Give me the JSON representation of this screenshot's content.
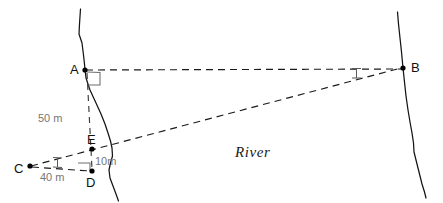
{
  "figure": {
    "caption_text": "River",
    "background_color": "#ffffff",
    "ink_color": "#141414",
    "dimension_color": "#777777"
  },
  "points": [
    {
      "id": "A",
      "label": "A",
      "x": 85,
      "y": 70,
      "label_x": 70,
      "label_y": 74
    },
    {
      "id": "B",
      "label": "B",
      "x": 403,
      "y": 68,
      "label_x": 411,
      "label_y": 72
    },
    {
      "id": "C",
      "label": "C",
      "x": 30,
      "y": 166,
      "label_x": 14,
      "label_y": 173
    },
    {
      "id": "D",
      "label": "D",
      "x": 92,
      "y": 171,
      "label_x": 86,
      "label_y": 187
    },
    {
      "id": "E",
      "label": "E",
      "x": 92,
      "y": 149,
      "label_x": 87,
      "label_y": 144
    }
  ],
  "dimensions": [
    {
      "id": "AE",
      "label": "50 m",
      "x": 38,
      "y": 122
    },
    {
      "id": "CD",
      "label": "40 m",
      "x": 40,
      "y": 180
    },
    {
      "id": "ED",
      "label": "10m",
      "x": 96,
      "y": 164
    }
  ],
  "segments": [
    {
      "id": "A-B",
      "from": "A",
      "to": "B",
      "style": "dashed"
    },
    {
      "id": "C-E-B",
      "from": "C",
      "to": "B",
      "style": "dashed",
      "through": "E"
    },
    {
      "id": "A-D",
      "from": "A",
      "to": "D",
      "style": "dashed-vertical"
    },
    {
      "id": "C-D",
      "from": "C",
      "to": "D",
      "style": "dashed"
    }
  ],
  "markers": [
    {
      "id": "right-angle-at-A",
      "kind": "right-angle",
      "at": "A"
    },
    {
      "id": "right-angle-at-D",
      "kind": "right-angle",
      "at": "D"
    },
    {
      "id": "angle-tick-at-B",
      "kind": "angle-tick",
      "at": "B"
    },
    {
      "id": "angle-tick-at-C",
      "kind": "angle-tick",
      "at": "C"
    }
  ],
  "banks": [
    {
      "id": "left-bank",
      "name": "left riverbank"
    },
    {
      "id": "right-bank",
      "name": "right riverbank"
    }
  ]
}
